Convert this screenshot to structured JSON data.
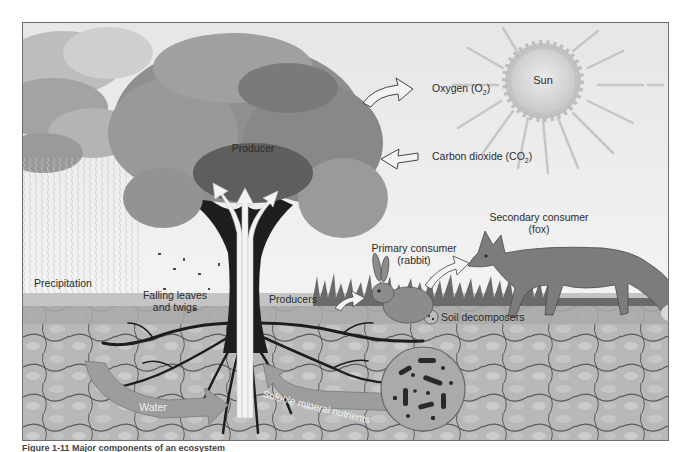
{
  "diagram": {
    "labels": {
      "sun": "Sun",
      "oxygen": "Oxygen (O",
      "oxygen_sub": "2",
      "oxygen_close": ")",
      "carbon_dioxide": "Carbon dioxide (CO",
      "carbon_dioxide_sub": "2",
      "carbon_dioxide_close": ")",
      "producer": "Producer",
      "secondary_consumer": "Secondary consumer",
      "secondary_consumer_animal": "(fox)",
      "primary_consumer": "Primary consumer",
      "primary_consumer_animal": "(rabbit)",
      "precipitation": "Precipitation",
      "falling_leaves_line1": "Falling leaves",
      "falling_leaves_line2": "and twigs",
      "producers": "Producers",
      "soil_decomposers": "Soil decomposers",
      "water": "Water",
      "soluble_mineral_nutrients": "Soluble mineral nutrients"
    },
    "caption": "Figure 1-11  Major components of an ecosystem"
  },
  "colors": {
    "sky": "#efefef",
    "cloud": "#a9a9a9",
    "tree_canopy": "#8c8c8c",
    "trunk": "#1e1e1e",
    "arrow_fill": "#f2f2f2",
    "soil": "#b5b5b5",
    "ground_band": "#a7a7a7",
    "water_arrow": "#9c9c9c",
    "sun_fill": "#d9d9d9",
    "fox": "#7d7d7d",
    "rabbit": "#8e8e8e"
  }
}
